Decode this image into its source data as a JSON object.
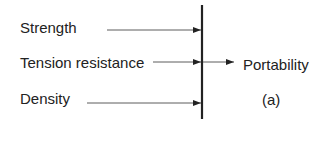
{
  "diagram": {
    "inputs": [
      {
        "label": "Strength",
        "y": 30,
        "line_start_x": 107
      },
      {
        "label": "Tension resistance",
        "y": 62,
        "line_start_x": 153
      },
      {
        "label": "Density",
        "y": 103,
        "line_start_x": 87
      }
    ],
    "output": {
      "label": "Portability",
      "caption": "(a)"
    },
    "bar": {
      "x": 202,
      "y1": 5,
      "y2": 119
    },
    "colors": {
      "line": "#222222",
      "text": "#222222",
      "background": "#ffffff"
    }
  }
}
